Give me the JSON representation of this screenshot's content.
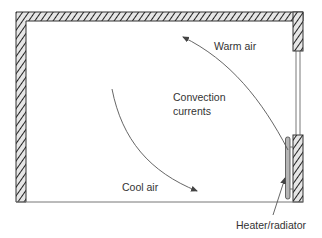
{
  "diagram": {
    "labels": {
      "warm_air": "Warm air",
      "convection_line1": "Convection",
      "convection_line2": "currents",
      "cool_air": "Cool air",
      "heater": "Heater/radiator"
    },
    "colors": {
      "wall_stroke": "#333333",
      "hatch": "#222222",
      "wall_fill": "#e6e6e6",
      "arrow": "#555555",
      "heater_fill": "#b5b5b5",
      "text": "#333333"
    },
    "elements": [
      {
        "name": "left-wall",
        "type": "hatched-wall"
      },
      {
        "name": "top-wall",
        "type": "hatched-wall"
      },
      {
        "name": "right-wall-upper",
        "type": "hatched-wall"
      },
      {
        "name": "window",
        "type": "double-line"
      },
      {
        "name": "right-wall-lower",
        "type": "hatched-wall"
      },
      {
        "name": "floor",
        "type": "line"
      },
      {
        "name": "heater-radiator",
        "type": "rounded-rect"
      },
      {
        "name": "cool-air-arrow",
        "type": "curved-arrow",
        "direction": "down-right"
      },
      {
        "name": "warm-air-arrow",
        "type": "curved-arrow",
        "direction": "up-left"
      },
      {
        "name": "heater-leader-arrow",
        "type": "arrow"
      }
    ]
  }
}
